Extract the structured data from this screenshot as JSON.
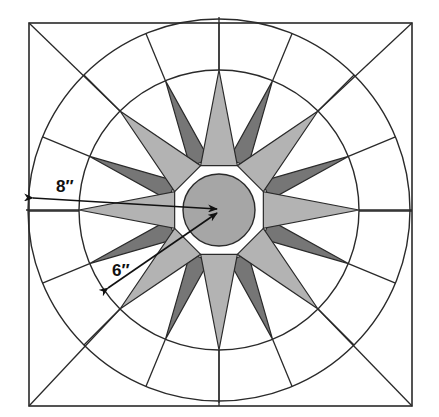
{
  "diagram": {
    "square": {
      "x": 29,
      "y": 23,
      "size": 383
    },
    "center": {
      "x": 219,
      "y": 210
    },
    "outer_circle_radius": 191,
    "inner_circle_radius": 140,
    "center_circle_radius": 36,
    "star_points": 16,
    "colors": {
      "line": "#2a2a2a",
      "light_point": "#b3b3b3",
      "dark_point": "#767676",
      "center_circle": "#a6a6a6",
      "background": "#ffffff"
    },
    "labels": {
      "outer_radius": "8″",
      "inner_radius": "6″"
    }
  }
}
